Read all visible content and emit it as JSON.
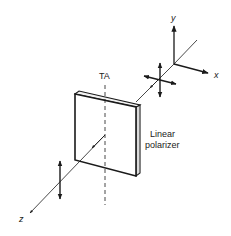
{
  "diagram": {
    "labels": {
      "y_axis": "y",
      "x_axis": "x",
      "z_axis": "z",
      "transmission_axis": "TA",
      "polarizer_line1": "Linear",
      "polarizer_line2": "polarizer"
    },
    "elements": [
      "coordinate-axes (x, y, z)",
      "unpolarized light indicator (crossed double arrows)",
      "linear polarizer plate",
      "transmission axis (dashed vertical line)",
      "linearly polarized output (vertical double arrow)"
    ],
    "colors": {
      "stroke": "#1a1a1a",
      "background": "#ffffff"
    }
  }
}
